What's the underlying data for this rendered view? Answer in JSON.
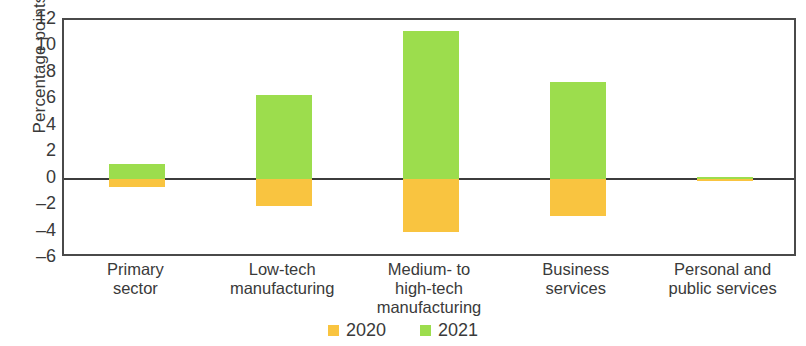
{
  "chart_data": {
    "type": "bar",
    "title": "",
    "subtitle": "",
    "xlabel": "",
    "ylabel": "Percentage points",
    "ylim": [
      -6,
      12
    ],
    "yticks": [
      12,
      10,
      8,
      6,
      4,
      2,
      0,
      -2,
      -4,
      -6
    ],
    "ytick_labels": [
      "12",
      "10",
      "8",
      "6",
      "4",
      "2",
      "0",
      "–2",
      "–4",
      "–6"
    ],
    "grid": false,
    "legend_position": "bottom-center",
    "categories": [
      "Primary sector",
      "Low-tech manufacturing",
      "Medium- to high-tech manufacturing",
      "Business services",
      "Personal and public services"
    ],
    "category_lines": [
      [
        "Primary",
        "sector"
      ],
      [
        "Low-tech",
        "manufacturing"
      ],
      [
        "Medium- to",
        "high-tech",
        "manufacturing"
      ],
      [
        "Business",
        "services"
      ],
      [
        "Personal and",
        "public services"
      ]
    ],
    "series": [
      {
        "name": "2020",
        "color": "#f9c440",
        "values": [
          -0.6,
          -2.1,
          -4.0,
          -2.8,
          -0.1
        ]
      },
      {
        "name": "2021",
        "color": "#9cdd4d",
        "values": [
          1.1,
          6.3,
          11.2,
          7.3,
          0.1
        ]
      }
    ],
    "axis_color": "#3c3c3c"
  },
  "legend": {
    "items": [
      {
        "label": "2020",
        "swatch": "legend-swatch-2020"
      },
      {
        "label": "2021",
        "swatch": "legend-swatch-2021"
      }
    ]
  }
}
